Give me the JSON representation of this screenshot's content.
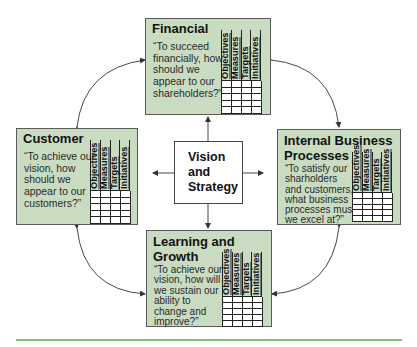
{
  "center": {
    "label": "Vision\nand\nStrategy"
  },
  "grid_columns": [
    "Objectives",
    "Measures",
    "Targets",
    "Initiatives"
  ],
  "grid_rows": 5,
  "perspectives": {
    "financial": {
      "title": "Financial",
      "question": "“To succeed\nfinancially, how\nshould we\nappear to our\nshareholders?”"
    },
    "customer": {
      "title": "Customer",
      "question": "“To achieve our\nvision, how\nshould we\nappear to our\ncustomers?”"
    },
    "internal": {
      "title": "Internal Business\nProcesses",
      "question": "“To satisfy our\nsharholders\nand customers,\nwhat business\nprocesses must\nwe excel at?”"
    },
    "learning": {
      "title": "Learning and\nGrowth",
      "question": "“To achieve our\nvision, how will\nwe sustain our\nability to\nchange and\nimprove?”"
    }
  },
  "colors": {
    "card_fill": "#c9dcc1",
    "card_border": "#5a5a5a",
    "rule": "#7cc46a",
    "arrow": "#333333"
  }
}
